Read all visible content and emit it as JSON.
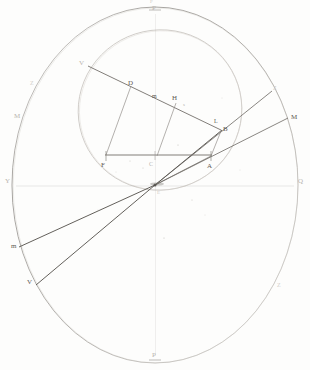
{
  "figure": {
    "background_color": "#fdfdfc",
    "ink_color": "#6e6a66",
    "faint_ink_color": "#b9b5b0"
  },
  "geometry": {
    "center": {
      "x": 155,
      "y": 185,
      "label": "C"
    },
    "outer_circle": {
      "cx": 155,
      "cy": 185,
      "rx": 143,
      "ry": 178
    },
    "inner_ellipse": {
      "cx": 160,
      "cy": 110,
      "rx": 82,
      "ry": 80,
      "rotation": -18
    },
    "horizontal_axis": {
      "x1": 12,
      "y1": 185,
      "x2": 298,
      "y2": 185
    },
    "vertical_axis": {
      "x1": 155,
      "y1": 7,
      "x2": 155,
      "y2": 363
    }
  },
  "labels": [
    {
      "id": "P-top",
      "text": "P",
      "x": 152,
      "y": 5,
      "size": "sz-7",
      "tone": "lbl-faint"
    },
    {
      "id": "P-top-ghost",
      "text": "P",
      "x": 150,
      "y": -1,
      "size": "sz-5",
      "tone": "lbl-vfaint"
    },
    {
      "id": "P-bottom",
      "text": "P",
      "x": 152,
      "y": 352,
      "size": "sz-7",
      "tone": "lbl-faint"
    },
    {
      "id": "Y-left",
      "text": "Y",
      "x": 5,
      "y": 178,
      "size": "sz-7",
      "tone": "lbl-faint"
    },
    {
      "id": "Q-right",
      "text": "Q",
      "x": 298,
      "y": 178,
      "size": "sz-7",
      "tone": "lbl-faint"
    },
    {
      "id": "M-left",
      "text": "M",
      "x": 14,
      "y": 113,
      "size": "sz-7",
      "tone": "lbl-faint"
    },
    {
      "id": "M-right",
      "text": "M",
      "x": 291,
      "y": 114,
      "size": "sz-7",
      "tone": "lbl-strong"
    },
    {
      "id": "Z-upper-left",
      "text": "Z",
      "x": 30,
      "y": 80,
      "size": "sz-6",
      "tone": "lbl-vfaint"
    },
    {
      "id": "Z-lower-right",
      "text": "Z",
      "x": 277,
      "y": 282,
      "size": "sz-6",
      "tone": "lbl-vfaint"
    },
    {
      "id": "V-upper",
      "text": "V",
      "x": 79,
      "y": 60,
      "size": "sz-7",
      "tone": "lbl-faint"
    },
    {
      "id": "D-point",
      "text": "D",
      "x": 128,
      "y": 80,
      "size": "sz-7",
      "tone": "lbl-strong"
    },
    {
      "id": "m-mid",
      "text": "m",
      "x": 152,
      "y": 93,
      "size": "sz-6",
      "tone": "lbl-strong"
    },
    {
      "id": "H-point",
      "text": "H",
      "x": 172,
      "y": 95,
      "size": "sz-7",
      "tone": "lbl-strong"
    },
    {
      "id": "s-point",
      "text": "s",
      "x": 183,
      "y": 102,
      "size": "sz-5",
      "tone": "lbl-faint"
    },
    {
      "id": "L-point",
      "text": "L",
      "x": 214,
      "y": 118,
      "size": "sz-6",
      "tone": "lbl-strong"
    },
    {
      "id": "B-point",
      "text": "B",
      "x": 223,
      "y": 126,
      "size": "sz-7",
      "tone": "lbl-strong"
    },
    {
      "id": "Z-upper-right",
      "text": "Z",
      "x": 273,
      "y": 85,
      "size": "sz-6",
      "tone": "lbl-vfaint"
    },
    {
      "id": "F-point",
      "text": "F",
      "x": 101,
      "y": 162,
      "size": "sz-7",
      "tone": "lbl-strong"
    },
    {
      "id": "C-center",
      "text": "C",
      "x": 149,
      "y": 161,
      "size": "sz-6",
      "tone": "lbl-faint"
    },
    {
      "id": "A-point",
      "text": "A",
      "x": 207,
      "y": 163,
      "size": "sz-7",
      "tone": "lbl-strong"
    },
    {
      "id": "E-center",
      "text": "E",
      "x": 157,
      "y": 190,
      "size": "sz-5",
      "tone": "lbl-vfaint"
    },
    {
      "id": "m-lower",
      "text": "m",
      "x": 11,
      "y": 243,
      "size": "sz-7",
      "tone": "lbl-strong"
    },
    {
      "id": "V-lower",
      "text": "V",
      "x": 27,
      "y": 279,
      "size": "sz-7",
      "tone": "lbl-strong"
    }
  ],
  "rays": [
    {
      "id": "ray-center-to-M-right",
      "x1": 155,
      "y1": 185,
      "x2": 288,
      "y2": 118,
      "weight": 0.8
    },
    {
      "id": "ray-center-to-Z-upper-right",
      "x1": 155,
      "y1": 185,
      "x2": 272,
      "y2": 91,
      "weight": 0.8
    },
    {
      "id": "ray-center-to-B",
      "x1": 155,
      "y1": 185,
      "x2": 222,
      "y2": 130,
      "weight": 0.9
    },
    {
      "id": "ray-center-to-m-lower",
      "x1": 155,
      "y1": 185,
      "x2": 19,
      "y2": 247,
      "weight": 0.9
    },
    {
      "id": "ray-center-to-V-lower",
      "x1": 155,
      "y1": 185,
      "x2": 36,
      "y2": 285,
      "weight": 0.9
    }
  ],
  "chords": [
    {
      "id": "chord-V-to-L",
      "x1": 88,
      "y1": 66,
      "x2": 221,
      "y2": 130,
      "weight": 0.85
    },
    {
      "id": "chord-F-to-A",
      "x1": 105,
      "y1": 155,
      "x2": 212,
      "y2": 155,
      "weight": 0.85
    },
    {
      "id": "drop-D-to-F",
      "x1": 131,
      "y1": 86,
      "x2": 106,
      "y2": 155,
      "weight": 0.7
    },
    {
      "id": "drop-H-to-C",
      "x1": 176,
      "y1": 103,
      "x2": 157,
      "y2": 156,
      "weight": 0.7
    },
    {
      "id": "drop-B-to-A",
      "x1": 221,
      "y1": 131,
      "x2": 211,
      "y2": 156,
      "weight": 0.7
    },
    {
      "id": "stem-F-down",
      "x1": 106,
      "y1": 155,
      "x2": 106,
      "y2": 160,
      "weight": 0.6
    }
  ],
  "ticks": [
    {
      "id": "tick-top-axis",
      "x": 155,
      "y": 10
    },
    {
      "id": "tick-bottom-axis",
      "x": 155,
      "y": 360
    }
  ],
  "speckles": [
    {
      "x": 178,
      "y": 145,
      "r": 0.6
    },
    {
      "x": 192,
      "y": 200,
      "r": 0.5
    },
    {
      "x": 205,
      "y": 215,
      "r": 0.4
    },
    {
      "x": 164,
      "y": 238,
      "r": 0.6
    },
    {
      "x": 130,
      "y": 161,
      "r": 0.5
    },
    {
      "x": 240,
      "y": 170,
      "r": 0.4
    },
    {
      "x": 98,
      "y": 210,
      "r": 0.4
    },
    {
      "x": 222,
      "y": 98,
      "r": 0.4
    },
    {
      "x": 143,
      "y": 168,
      "r": 0.5
    },
    {
      "x": 116,
      "y": 172,
      "r": 0.4
    }
  ]
}
